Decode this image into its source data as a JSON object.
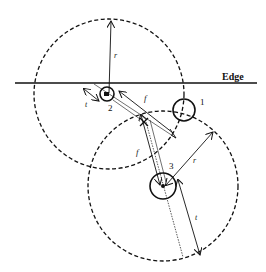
{
  "diagram": {
    "edge_label": "Edge",
    "nodes": [
      {
        "id": "1",
        "label": "1"
      },
      {
        "id": "2",
        "label": "2"
      },
      {
        "id": "3",
        "label": "3"
      }
    ],
    "labels": {
      "r_upper": "r",
      "r_lower": "r",
      "f_upper": "f",
      "f_lower": "f",
      "t_upper": "t",
      "t_lower": "t"
    },
    "colors": {
      "line": "#111111",
      "background": "#ffffff"
    }
  }
}
